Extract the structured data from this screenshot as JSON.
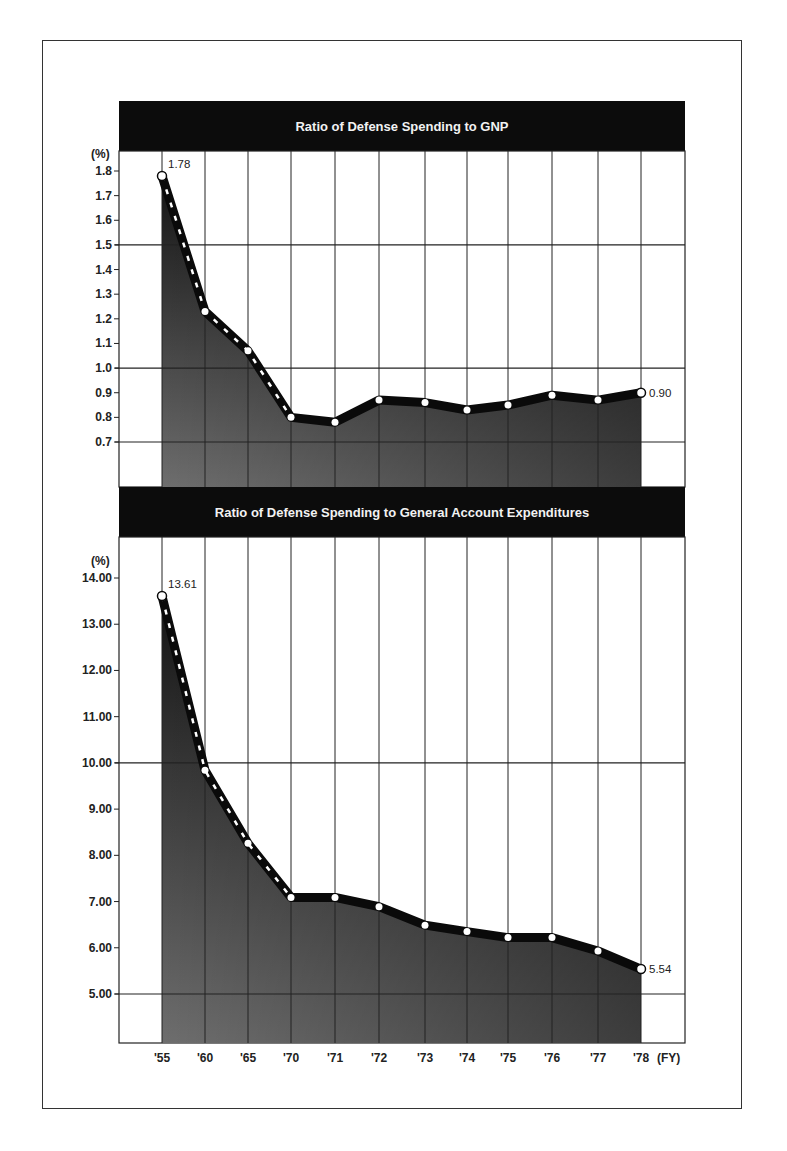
{
  "chart_data": [
    {
      "type": "area",
      "title": "Ratio of Defense Spending to GNP",
      "ylabel": "(%)",
      "xlabel": "(FY)",
      "categories": [
        "'55",
        "'60",
        "'65",
        "'70",
        "'71",
        "'72",
        "'73",
        "'74",
        "'75",
        "'76",
        "'77",
        "'78"
      ],
      "values": [
        1.78,
        1.23,
        1.07,
        0.8,
        0.78,
        0.87,
        0.86,
        0.83,
        0.85,
        0.89,
        0.87,
        0.9
      ],
      "labeled_points": [
        {
          "index": 0,
          "label": "1.78"
        },
        {
          "index": 11,
          "label": "0.90"
        }
      ],
      "yticks": [
        "1.8",
        "1.7",
        "1.6",
        "1.5",
        "1.4",
        "1.3",
        "1.2",
        "1.1",
        "1.0",
        "0.9",
        "0.8",
        "0.7"
      ],
      "ytick_values": [
        1.8,
        1.7,
        1.6,
        1.5,
        1.4,
        1.3,
        1.2,
        1.1,
        1.0,
        0.9,
        0.8,
        0.7
      ],
      "major_gridlines": [
        1.5,
        1.0,
        0.7
      ],
      "ylim": [
        0.52,
        1.87
      ],
      "grid": true,
      "legend": "none"
    },
    {
      "type": "area",
      "title": "Ratio of Defense Spending to General Account Expenditures",
      "ylabel": "(%)",
      "xlabel": "(FY)",
      "categories": [
        "'55",
        "'60",
        "'65",
        "'70",
        "'71",
        "'72",
        "'73",
        "'74",
        "'75",
        "'76",
        "'77",
        "'78"
      ],
      "values": [
        13.61,
        9.84,
        8.26,
        7.09,
        7.09,
        6.89,
        6.49,
        6.35,
        6.22,
        6.22,
        5.93,
        5.54
      ],
      "labeled_points": [
        {
          "index": 0,
          "label": "13.61"
        },
        {
          "index": 11,
          "label": "5.54"
        }
      ],
      "yticks": [
        "14.00",
        "13.00",
        "12.00",
        "11.00",
        "10.00",
        "9.00",
        "8.00",
        "7.00",
        "6.00",
        "5.00"
      ],
      "ytick_values": [
        14,
        13,
        12,
        11,
        10,
        9,
        8,
        7,
        6,
        5
      ],
      "major_gridlines": [
        10,
        5
      ],
      "ylim": [
        4.0,
        14.9
      ],
      "grid": true,
      "legend": "none"
    }
  ],
  "layout": {
    "plot_left": 119,
    "plot_right": 685,
    "x_positions": [
      162,
      205,
      248,
      291,
      335,
      379,
      425,
      467,
      508,
      552,
      598,
      641
    ],
    "charts": [
      {
        "header_top": 101,
        "header_bottom": 151,
        "plot_top": 151,
        "plot_bottom": 487,
        "y_at_top_tick": 171,
        "y_at_bottom_tick": 442
      },
      {
        "header_top": 487,
        "header_bottom": 537,
        "plot_top": 537,
        "plot_bottom": 1043,
        "y_at_top_tick": 578,
        "y_at_bottom_tick": 994
      }
    ],
    "x_label_y": 1062
  },
  "colors": {
    "header_bg": "#0c0c0c",
    "header_text": "#f2f2f2",
    "fill_top": "#1a1a1a",
    "fill_bottom": "#6a6a6a",
    "line": "#0a0a0a",
    "grid": "#222222",
    "marker": "#ffffff"
  }
}
